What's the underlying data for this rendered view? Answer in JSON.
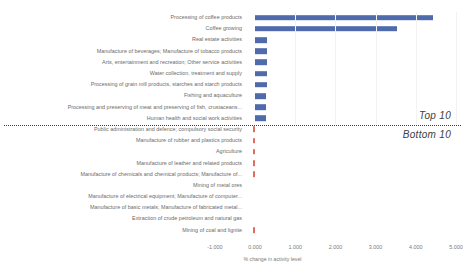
{
  "chart_data": {
    "type": "bar",
    "orientation": "horizontal",
    "title": "",
    "subtitle": "",
    "xlabel": "% change in activity level",
    "ylabel": "",
    "xlim": [
      -1.0,
      5.0
    ],
    "xticks": [
      -1.0,
      0.0,
      1.0,
      2.0,
      3.0,
      4.0,
      5.0
    ],
    "xtick_labels": [
      "-1.000",
      "0.000",
      "1.000",
      "2.000",
      "3.000",
      "4.000",
      "5.000"
    ],
    "grid": false,
    "legend": null,
    "categories": [
      "Processing of coffee products",
      "Coffee growing",
      "Real estate activities",
      "Manufacture of beverages; Manufacture of tobacco products",
      "Arts, entertainment and recreation; Other service activities",
      "Water collection, treatment and supply",
      "Processing of grain mill products, starches and starch products",
      "Fishing and aquaculture",
      "Processing and preserving of meat and preserving of fish, crustaceans...",
      "Human health and social work activities",
      "Public administration and defence; compulsory social security",
      "Manufacture of rubber and plastics products",
      "Agriculture",
      "Manufacture of leather and related products",
      "Manufacture of chemicals and chemical products; Manufacture of...",
      "Mining of metal ores",
      "Manufacture of electrical equipment; Manufacture of computer...",
      "Manufacture of basic metals; Manufacture of fabricated metal...",
      "Extraction of crude petroleum and natural gas",
      "Mining of coal and lignite"
    ],
    "values": [
      4.43,
      3.53,
      0.3,
      0.3,
      0.3,
      0.295,
      0.29,
      0.285,
      0.28,
      0.275,
      -0.045,
      -0.05,
      -0.05,
      -0.05,
      -0.02,
      0.0,
      0.0,
      0.0,
      0.0,
      -0.05
    ],
    "annotations": [
      {
        "text": "Top 10",
        "position": "right-above-divider"
      },
      {
        "text": "Bottom 10",
        "position": "right-below-divider"
      }
    ],
    "colors": {
      "positive_bar": "#4f6bac",
      "negative_bar": "#e06c5f",
      "divider": "#3a3a3a",
      "text": "#6b6b6b",
      "background": "#ffffff"
    }
  }
}
